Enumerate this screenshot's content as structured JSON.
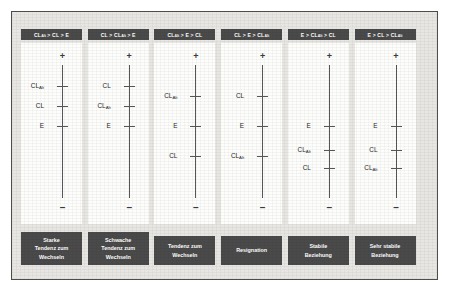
{
  "figure": {
    "background_color": "#e8e6e3",
    "frame_border_color": "#4d4d4d",
    "chip_color": "#4a4a4a",
    "chip_text_color": "#ffffff",
    "axis_color": "#575757",
    "plot_background": "#fdfdfc"
  },
  "axis": {
    "top_symbol": "+",
    "bottom_symbol": "–"
  },
  "panels": [
    {
      "header": {
        "parts": [
          {
            "text": "CL",
            "sub": "Alt"
          },
          {
            "text": " > CL > E"
          }
        ]
      },
      "header_plain": "CL_Alt > CL > E",
      "ticks": [
        {
          "label": "CL",
          "sub": "Alt",
          "y": 43
        },
        {
          "label": "CL",
          "sub": "",
          "y": 63
        },
        {
          "label": "E",
          "sub": "",
          "y": 83
        }
      ],
      "caption_lines": [
        "Starke",
        "Tendenz zum",
        "Wechseln"
      ],
      "caption_plain": "Starke Tendenz zum Wechseln"
    },
    {
      "header": {
        "parts": [
          {
            "text": "CL > CL"
          },
          {
            "text": "",
            "sub": "Alt"
          },
          {
            "text": " > E"
          }
        ]
      },
      "header_plain": "CL > CL_Alt > E",
      "ticks": [
        {
          "label": "CL",
          "sub": "",
          "y": 43
        },
        {
          "label": "CL",
          "sub": "Alt",
          "y": 63
        },
        {
          "label": "E",
          "sub": "",
          "y": 83
        }
      ],
      "caption_lines": [
        "Schwache",
        "Tendenz zum",
        "Wechseln"
      ],
      "caption_plain": "Schwache Tendenz zum Wechseln"
    },
    {
      "header": {
        "parts": [
          {
            "text": "CL",
            "sub": "Alt"
          },
          {
            "text": " > E > CL"
          }
        ]
      },
      "header_plain": "CL_Alt > E > CL",
      "ticks": [
        {
          "label": "CL",
          "sub": "Alt",
          "y": 53
        },
        {
          "label": "E",
          "sub": "",
          "y": 83
        },
        {
          "label": "CL",
          "sub": "",
          "y": 113
        }
      ],
      "caption_lines": [
        "Tendenz zum",
        "Wechseln"
      ],
      "caption_plain": "Tendenz zum Wechseln"
    },
    {
      "header": {
        "parts": [
          {
            "text": "CL > E > CL"
          },
          {
            "text": "",
            "sub": "Alt"
          }
        ]
      },
      "header_plain": "CL > E > CL_Alt",
      "ticks": [
        {
          "label": "CL",
          "sub": "",
          "y": 53
        },
        {
          "label": "E",
          "sub": "",
          "y": 83
        },
        {
          "label": "CL",
          "sub": "Alt",
          "y": 113
        }
      ],
      "caption_lines": [
        "Resignation"
      ],
      "caption_plain": "Resignation"
    },
    {
      "header": {
        "parts": [
          {
            "text": "E > CL"
          },
          {
            "text": "",
            "sub": "Alt"
          },
          {
            "text": " > CL"
          }
        ]
      },
      "header_plain": "E > CL_Alt > CL",
      "ticks": [
        {
          "label": "E",
          "sub": "",
          "y": 83
        },
        {
          "label": "CL",
          "sub": "Alt",
          "y": 107
        },
        {
          "label": "CL",
          "sub": "",
          "y": 125
        }
      ],
      "caption_lines": [
        "Stabile",
        "Beziehung"
      ],
      "caption_plain": "Stabile Beziehung"
    },
    {
      "header": {
        "parts": [
          {
            "text": "E > CL > CL"
          },
          {
            "text": "",
            "sub": "Alt"
          }
        ]
      },
      "header_plain": "E > CL > CL_Alt",
      "ticks": [
        {
          "label": "E",
          "sub": "",
          "y": 83
        },
        {
          "label": "CL",
          "sub": "",
          "y": 107
        },
        {
          "label": "CL",
          "sub": "Alt",
          "y": 125
        }
      ],
      "caption_lines": [
        "Sehr stabile",
        "Beziehung"
      ],
      "caption_plain": "Sehr stabile Beziehung"
    }
  ]
}
